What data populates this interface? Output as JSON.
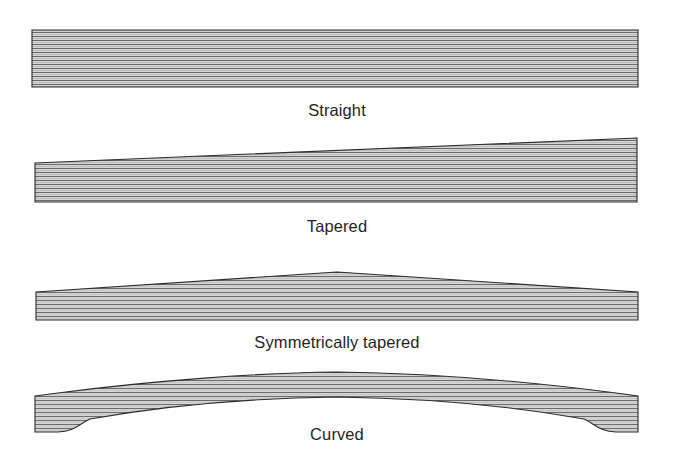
{
  "figure": {
    "background_color": "#ffffff",
    "line_color": "#2b2b2b",
    "hatch_fill_light": "#d2d2d2",
    "hatch_line_color": "#606060",
    "label_color": "#1f1f1f"
  },
  "shapes": [
    {
      "id": "straight",
      "label": "Straight",
      "description": "Constant-depth rectangular beam with horizontal laminations",
      "label_x": 337,
      "label_y": 116,
      "geometry": {
        "type": "polygon",
        "points": "32,30 638,30 638,87 32,87"
      }
    },
    {
      "id": "tapered",
      "label": "Tapered",
      "description": "Beam whose depth increases linearly from left end to right end",
      "label_x": 337,
      "label_y": 232,
      "geometry": {
        "type": "polygon",
        "points": "35,163 637,138 637,202 35,202"
      }
    },
    {
      "id": "symmetrically-tapered",
      "label": "Symmetrically tapered",
      "description": "Double-tapered beam peaking at midspan, symmetric about the centre",
      "label_x": 337,
      "label_y": 348,
      "geometry": {
        "type": "polygon",
        "points": "36,292 337,272 638,292 638,320 36,320"
      }
    },
    {
      "id": "curved",
      "label": "Curved",
      "description": "Curved (cambered) beam with arched top and curved soffit rising from the ends",
      "label_x": 337,
      "label_y": 440,
      "geometry": {
        "type": "path",
        "d": "M 35,396 L 58,393 C 150,381 255,373 337,372 C 420,373 524,381 616,393 L 638,396 L 638,432 L 616,432 C 600,432 595,424 584,419 C 500,404 415,398 337,397 C 259,398 174,404 90,419 C 79,424 74,432 58,432 L 35,432 Z"
      }
    }
  ],
  "hatching": {
    "pattern": "horizontal-lamination-lines",
    "spacing_px": 4,
    "orientation": "horizontal"
  }
}
